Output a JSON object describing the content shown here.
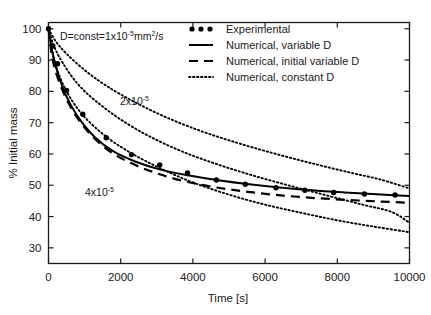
{
  "chart_data": {
    "type": "line",
    "title": "",
    "xlabel": "Time [s]",
    "ylabel": "% Initial mass",
    "xlim": [
      0,
      10000
    ],
    "ylim": [
      25,
      102
    ],
    "xticks": [
      0,
      2000,
      4000,
      6000,
      8000,
      10000
    ],
    "yticks": [
      30,
      40,
      50,
      60,
      70,
      80,
      90,
      100
    ],
    "xtick_labels": [
      "0",
      "2000",
      "4000",
      "6000",
      "8000",
      "10000"
    ],
    "ytick_labels": [
      "30",
      "40",
      "50",
      "60",
      "70",
      "80",
      "90",
      "100"
    ],
    "grid": false,
    "legend_position": "top-right",
    "series": [
      {
        "name": "Experimental",
        "style": "markers",
        "marker": "filled-circle",
        "x": [
          0,
          120,
          250,
          500,
          950,
          1600,
          2300,
          3080,
          3850,
          4650,
          5450,
          6300,
          7100,
          7900,
          8750,
          9600
        ],
        "y": [
          100,
          94.5,
          88.8,
          80.3,
          72.7,
          65.2,
          59.8,
          56.5,
          53.9,
          51.7,
          50.3,
          49.2,
          48.4,
          47.7,
          47.2,
          46.9
        ]
      },
      {
        "name": "Numerical, variable D",
        "style": "solid",
        "x": [
          0,
          100,
          200,
          400,
          600,
          900,
          1300,
          1800,
          2400,
          3100,
          3900,
          4700,
          5500,
          6400,
          7300,
          8200,
          9100,
          10000
        ],
        "y": [
          100,
          93.0,
          88.0,
          81.0,
          76.0,
          70.5,
          65.2,
          60.8,
          57.6,
          55.0,
          53.1,
          51.6,
          50.4,
          49.3,
          48.4,
          47.7,
          47.1,
          46.6
        ]
      },
      {
        "name": "Numerical, initial variable D",
        "style": "dashed",
        "x": [
          0,
          100,
          250,
          500,
          800,
          1200,
          1700,
          2300,
          3000,
          3800,
          4700,
          5600,
          6500,
          7400,
          8300,
          9200,
          10000
        ],
        "y": [
          100,
          91.0,
          84.5,
          77.5,
          71.5,
          65.8,
          60.8,
          57.0,
          53.8,
          51.2,
          49.2,
          47.8,
          46.7,
          45.9,
          45.3,
          44.8,
          44.4
        ]
      },
      {
        "name": "Numerical, constant D",
        "label": "D=const=1x10-5 mm2/s",
        "style": "dotted",
        "annotation": "D=const=1x10",
        "x": [
          0,
          200,
          500,
          1000,
          1600,
          2400,
          3300,
          4300,
          5300,
          6300,
          7300,
          8300,
          9200,
          10000
        ],
        "y": [
          100,
          96.0,
          92.0,
          86.8,
          81.8,
          76.5,
          71.5,
          67.0,
          63.3,
          60.0,
          57.0,
          54.2,
          51.8,
          49.0
        ]
      },
      {
        "name": "Numerical, constant D 2x10-5",
        "label": "2x10-5",
        "style": "dotted",
        "x": [
          0,
          150,
          400,
          800,
          1300,
          2000,
          2800,
          3700,
          4700,
          5700,
          6700,
          7700,
          8700,
          9500,
          10000
        ],
        "y": [
          100,
          94.5,
          89.0,
          82.5,
          77.0,
          71.0,
          65.6,
          60.8,
          56.6,
          53.0,
          49.8,
          46.8,
          43.8,
          41.5,
          38.0
        ]
      },
      {
        "name": "Numerical, constant D 4x10-5",
        "label": "4x10-5",
        "style": "dotted",
        "x": [
          0,
          120,
          300,
          600,
          1000,
          1600,
          2300,
          3100,
          4000,
          5000,
          6000,
          7000,
          8000,
          9000,
          10000
        ],
        "y": [
          100,
          92.0,
          85.0,
          78.0,
          71.8,
          65.5,
          60.2,
          55.4,
          50.9,
          47.0,
          43.8,
          41.2,
          38.8,
          36.8,
          35.0
        ]
      }
    ],
    "annotations": [
      {
        "id": "annot-const-d",
        "text_prefix": "D=const=1x10",
        "text_sup": "-5",
        "text_suffix_a": "mm",
        "text_sup_b": "2",
        "text_suffix_b": "/s",
        "x": 2000,
        "y": 94
      },
      {
        "id": "annot-2e5",
        "text_prefix": "2x10",
        "text_sup": "-5",
        "x": 2700,
        "y": 71
      },
      {
        "id": "annot-4e5",
        "text_prefix": "4x10",
        "text_sup": "-5",
        "x": 1700,
        "y": 45
      }
    ],
    "legend": [
      {
        "label": "Experimental",
        "marker": "dots"
      },
      {
        "label": "Numerical, variable D",
        "marker": "solid-line"
      },
      {
        "label": "Numerical, initial variable D",
        "marker": "dashed-line"
      },
      {
        "label": "Numerical, constant D",
        "marker": "dotted-line"
      }
    ]
  },
  "colors": {
    "axis": "#1a1a1a",
    "series": "#000000",
    "background": "#ffffff"
  }
}
